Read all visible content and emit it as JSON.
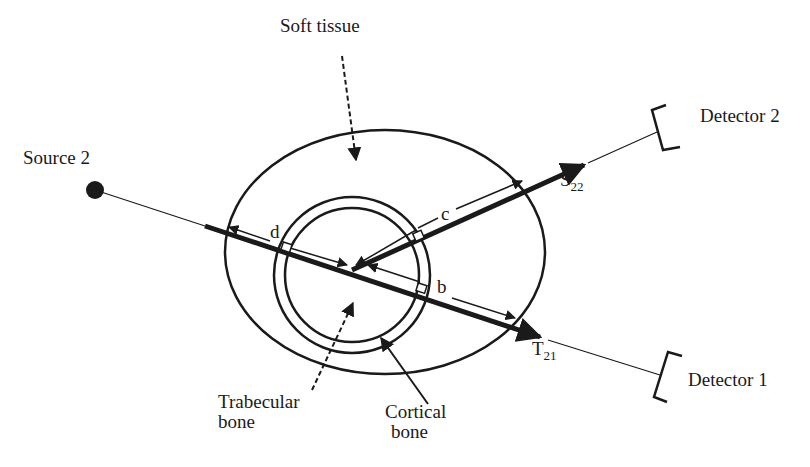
{
  "labels": {
    "soft_tissue": "Soft tissue",
    "source": "Source 2",
    "detector2": "Detector 2",
    "detector1": "Detector 1",
    "trabecular": {
      "line1": "Trabecular",
      "line2": "bone"
    },
    "cortical": {
      "line1": "Cortical",
      "line2": "bone"
    },
    "path_b": "b",
    "path_c": "c",
    "path_d": "d",
    "scatter": {
      "main": "S",
      "sub": "22"
    },
    "transmit": {
      "main": "T",
      "sub": "21"
    }
  },
  "colors": {
    "ink": "#1a1a1a",
    "background": "#ffffff"
  }
}
